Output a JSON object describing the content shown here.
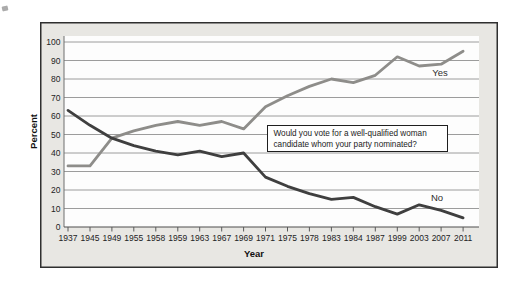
{
  "colors": {
    "panel_bg": "#e8e7e3",
    "plot_bg": "#fdfdfd",
    "grid": "#9c9c9c",
    "x_axis": "#4f4f4f",
    "y_axis": "#6e6e6e",
    "yes_line": "#8e8d8a",
    "no_line": "#3f3f3f"
  },
  "chart_data": {
    "type": "line",
    "title": "",
    "xlabel": "Year",
    "ylabel": "Percent",
    "ylim": [
      0,
      100
    ],
    "ytick_step": 10,
    "grid": "horizontal-gridlines",
    "legend": "inline-series-labels",
    "annotation": "Would you vote for a well-qualified woman candidate whom your party nominated?",
    "categories": [
      "1937",
      "1945",
      "1949",
      "1955",
      "1958",
      "1959",
      "1963",
      "1967",
      "1969",
      "1971",
      "1975",
      "1978",
      "1983",
      "1984",
      "1987",
      "1999",
      "2003",
      "2007",
      "2011"
    ],
    "series": [
      {
        "name": "Yes",
        "color": "#8e8d8a",
        "values": [
          33,
          33,
          48,
          52,
          55,
          57,
          55,
          57,
          53,
          65,
          71,
          76,
          80,
          78,
          82,
          92,
          87,
          88,
          95
        ]
      },
      {
        "name": "No",
        "color": "#3f3f3f",
        "values": [
          63,
          55,
          48,
          44,
          41,
          39,
          41,
          38,
          40,
          27,
          22,
          18,
          15,
          16,
          11,
          7,
          12,
          9,
          5
        ]
      }
    ]
  },
  "annotation_box": {
    "line1": "Would you vote for a well-qualified woman",
    "line2": "candidate whom your party nominated?"
  }
}
